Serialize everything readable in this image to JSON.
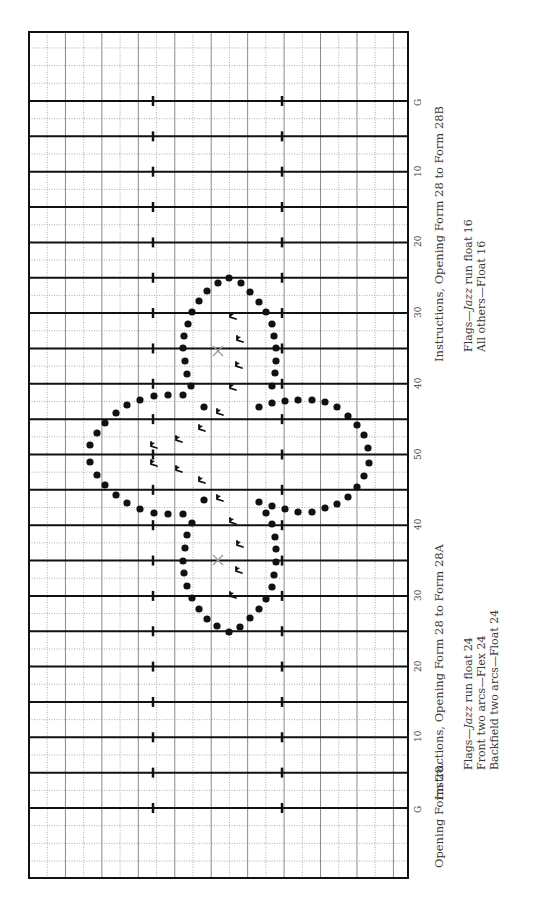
{
  "figure": {
    "caption": "Opening Form 28.",
    "field": {
      "orientation": "rotated-90",
      "yard_labels": [
        "G",
        "10",
        "20",
        "30",
        "40",
        "50",
        "40",
        "30",
        "20",
        "10",
        "G"
      ],
      "colors": {
        "yard_line": "#111111",
        "grid_solid": "#8a8a8a",
        "grid_dotted": "#9a9a9a",
        "dot": "#111111",
        "marker": "#999999"
      }
    },
    "instructions_a": {
      "title": "Instructions, Opening Form 28 to Form 28A",
      "lines": [
        {
          "pre": "Flags—",
          "em": "Jazz",
          "post": " run float 24"
        },
        {
          "text": "Front two arcs—Flex 24"
        },
        {
          "text": "Backfield two arcs—Float 24"
        }
      ]
    },
    "instructions_b": {
      "title": "Instructions, Opening Form 28 to Form 28B",
      "lines": [
        {
          "pre": "Flags—",
          "em": "Jazz",
          "post": " run float 16"
        },
        {
          "text": "All others—Float 16"
        }
      ]
    },
    "formation": {
      "markers": [
        {
          "type": "x",
          "x": 218,
          "y": 351
        },
        {
          "type": "x",
          "x": 218,
          "y": 560
        }
      ],
      "dots": [
        [
          229,
          278
        ],
        [
          218,
          283
        ],
        [
          207,
          291
        ],
        [
          199,
          301
        ],
        [
          192,
          312
        ],
        [
          188,
          324
        ],
        [
          184,
          336
        ],
        [
          183,
          348
        ],
        [
          185,
          361
        ],
        [
          187,
          374
        ],
        [
          191,
          386
        ],
        [
          241,
          283
        ],
        [
          250,
          292
        ],
        [
          259,
          302
        ],
        [
          266,
          312
        ],
        [
          272,
          324
        ],
        [
          274,
          336
        ],
        [
          276,
          348
        ],
        [
          276,
          361
        ],
        [
          275,
          373
        ],
        [
          272,
          386
        ],
        [
          183,
          395
        ],
        [
          168,
          395
        ],
        [
          154,
          396
        ],
        [
          140,
          400
        ],
        [
          127,
          405
        ],
        [
          116,
          413
        ],
        [
          105,
          423
        ],
        [
          97,
          433
        ],
        [
          90,
          445
        ],
        [
          90,
          462
        ],
        [
          97,
          475
        ],
        [
          105,
          485
        ],
        [
          116,
          495
        ],
        [
          127,
          503
        ],
        [
          140,
          509
        ],
        [
          154,
          513
        ],
        [
          168,
          514
        ],
        [
          183,
          514
        ],
        [
          204,
          407
        ],
        [
          204,
          500
        ],
        [
          259,
          407
        ],
        [
          272,
          403
        ],
        [
          285,
          401
        ],
        [
          298,
          400
        ],
        [
          312,
          400
        ],
        [
          325,
          402
        ],
        [
          337,
          407
        ],
        [
          348,
          416
        ],
        [
          357,
          425
        ],
        [
          364,
          435
        ],
        [
          368,
          448
        ],
        [
          369,
          463
        ],
        [
          364,
          476
        ],
        [
          357,
          487
        ],
        [
          348,
          497
        ],
        [
          337,
          504
        ],
        [
          325,
          508
        ],
        [
          312,
          512
        ],
        [
          298,
          512
        ],
        [
          285,
          509
        ],
        [
          272,
          506
        ],
        [
          266,
          513
        ],
        [
          259,
          502
        ],
        [
          192,
          523
        ],
        [
          187,
          535
        ],
        [
          185,
          548
        ],
        [
          183,
          561
        ],
        [
          184,
          573
        ],
        [
          187,
          586
        ],
        [
          192,
          598
        ],
        [
          199,
          609
        ],
        [
          207,
          619
        ],
        [
          217,
          626
        ],
        [
          229,
          632
        ],
        [
          240,
          627
        ],
        [
          250,
          618
        ],
        [
          259,
          609
        ],
        [
          266,
          599
        ],
        [
          272,
          587
        ],
        [
          274,
          575
        ],
        [
          276,
          562
        ],
        [
          276,
          549
        ],
        [
          275,
          537
        ],
        [
          272,
          524
        ]
      ],
      "flags": [
        [
          233,
          316
        ],
        [
          240,
          339
        ],
        [
          239,
          365
        ],
        [
          233,
          387
        ],
        [
          220,
          412
        ],
        [
          202,
          428
        ],
        [
          179,
          439
        ],
        [
          154,
          445
        ],
        [
          154,
          463
        ],
        [
          179,
          469
        ],
        [
          202,
          480
        ],
        [
          220,
          498
        ],
        [
          233,
          521
        ],
        [
          240,
          544
        ],
        [
          239,
          570
        ],
        [
          233,
          595
        ]
      ]
    }
  }
}
